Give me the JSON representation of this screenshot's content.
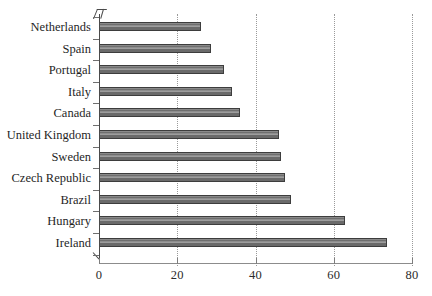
{
  "chart_data": {
    "type": "bar",
    "orientation": "horizontal",
    "title": "",
    "xlabel": "",
    "ylabel": "",
    "xlim": [
      0,
      80
    ],
    "xticks": [
      0,
      20,
      40,
      60,
      80
    ],
    "xtick_labels": [
      "0",
      "20",
      "40",
      "60",
      "80"
    ],
    "grid": true,
    "grid_axis": "x",
    "legend": false,
    "bar_color": "#6e6e6e",
    "bar_edge_color": "#3d3d3d",
    "axis_color": "#4a4a4a",
    "gridline_color": "#9a9a9a",
    "background_color": "#ffffff",
    "categories": [
      "Netherlands",
      "Spain",
      "Portugal",
      "Italy",
      "Canada",
      "United Kingdom",
      "Sweden",
      "Czech Republic",
      "Brazil",
      "Hungary",
      "Ireland"
    ],
    "values": [
      26,
      28.5,
      32,
      34,
      36,
      46,
      46.5,
      47.5,
      49,
      63,
      73.5
    ]
  }
}
